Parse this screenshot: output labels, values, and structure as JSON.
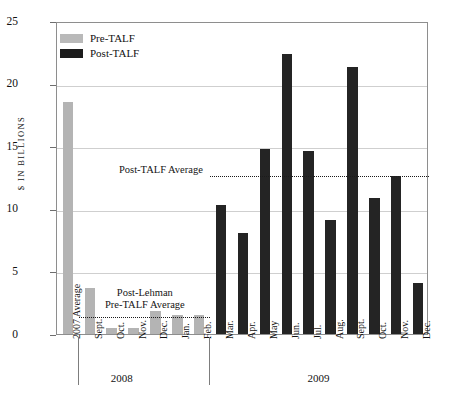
{
  "chart_data": {
    "type": "bar",
    "title": "",
    "xlabel": "",
    "ylabel": "$ IN BILLIONS",
    "ylim": [
      0,
      25
    ],
    "yticks": [
      0,
      5,
      10,
      15,
      20,
      25
    ],
    "grid": true,
    "legend_position": "top-left",
    "categories": [
      "2007 Average",
      "Sept.",
      "Oct.",
      "Nov.",
      "Dec.",
      "Jan.",
      "Feb.",
      "Mar.",
      "Apr.",
      "May",
      "Jun.",
      "Jul.",
      "Aug.",
      "Sept.",
      "Oct.",
      "Nov.",
      "Dec."
    ],
    "values": [
      18.5,
      3.7,
      0.5,
      0.5,
      1.8,
      1.5,
      1.5,
      10.3,
      8.1,
      14.8,
      22.4,
      14.6,
      9.1,
      21.3,
      10.9,
      12.6,
      4.1
    ],
    "series_of": [
      "Pre-TALF",
      "Pre-TALF",
      "Pre-TALF",
      "Pre-TALF",
      "Pre-TALF",
      "Pre-TALF",
      "Pre-TALF",
      "Post-TALF",
      "Post-TALF",
      "Post-TALF",
      "Post-TALF",
      "Post-TALF",
      "Post-TALF",
      "Post-TALF",
      "Post-TALF",
      "Post-TALF",
      "Post-TALF"
    ],
    "series": [
      {
        "name": "Pre-TALF",
        "color": "#b4b4b4"
      },
      {
        "name": "Post-TALF",
        "color": "#242424"
      }
    ],
    "group_labels": [
      {
        "label": "2008",
        "from": 1,
        "to": 4
      },
      {
        "label": "2009",
        "from": 7,
        "to": 16
      }
    ],
    "annotations": [
      {
        "name": "post-talf-average",
        "label": "Post-TALF Average",
        "value": 12.8,
        "from": 7,
        "to": 16
      },
      {
        "name": "post-lehman-pre-talf-average",
        "label_line1": "Post-Lehman",
        "label_line2": "Pre-TALF Average",
        "value": 1.5,
        "from": 1,
        "to": 6
      }
    ]
  },
  "legend": {
    "items": [
      {
        "label": "Pre-TALF",
        "color": "#b9b9b9"
      },
      {
        "label": "Post-TALF",
        "color": "#1c1c1c"
      }
    ]
  },
  "axis": {
    "y_title": "$ IN BILLIONS",
    "y_tick_labels": [
      "25",
      "20",
      "15",
      "10",
      "5",
      "0"
    ]
  },
  "x_labels": [
    "2007 Average",
    "Sept.",
    "Oct.",
    "Nov.",
    "Dec.",
    "Jan.",
    "Feb.",
    "Mar.",
    "Apr.",
    "May",
    "Jun.",
    "Jul.",
    "Aug.",
    "Sept.",
    "Oct.",
    "Nov.",
    "Dec."
  ],
  "year_groups": [
    "2008",
    "2009"
  ],
  "annotation_text": {
    "post_talf_average": "Post-TALF Average",
    "post_lehman_line1": "Post-Lehman",
    "post_lehman_line2": "Pre-TALF Average"
  }
}
